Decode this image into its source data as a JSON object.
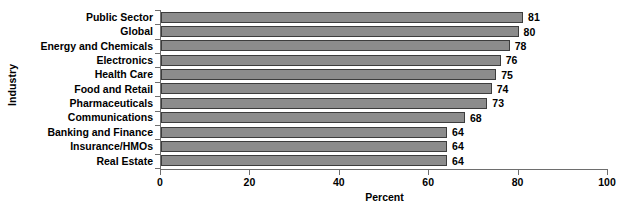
{
  "chart_data": {
    "type": "bar",
    "orientation": "horizontal",
    "title": "",
    "xlabel": "Percent",
    "ylabel": "Industry",
    "xlim": [
      0,
      100
    ],
    "xticks": [
      0,
      20,
      40,
      60,
      80,
      100
    ],
    "xtick_labels": [
      "0",
      "20",
      "40",
      "60",
      "80",
      "100"
    ],
    "grid": false,
    "legend": "none",
    "bar_color": "#8c8c8c",
    "bar_edge_color": "#3d3d3d",
    "axis_color": "#6e6e6e",
    "categories": [
      "Public Sector",
      "Global",
      "Energy and Chemicals",
      "Electronics",
      "Health Care",
      "Food and Retail",
      "Pharmaceuticals",
      "Communications",
      "Banking and Finance",
      "Insurance/HMOs",
      "Real Estate"
    ],
    "values": [
      81,
      80,
      78,
      76,
      75,
      74,
      73,
      68,
      64,
      64,
      64
    ],
    "value_labels": [
      "81",
      "80",
      "78",
      "76",
      "75",
      "74",
      "73",
      "68",
      "64",
      "64",
      "64"
    ]
  }
}
